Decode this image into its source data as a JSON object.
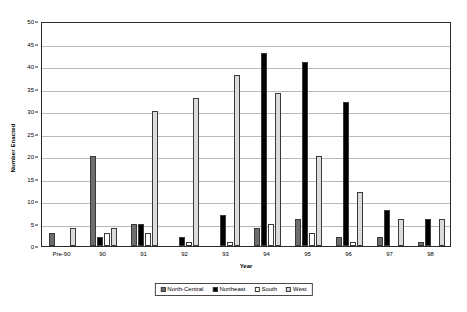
{
  "chart_data": {
    "type": "bar",
    "title": "",
    "xlabel": "Year",
    "ylabel": "Number Enacted",
    "categories": [
      "Pre-90",
      "90",
      "91",
      "92",
      "93",
      "94",
      "95",
      "96",
      "97",
      "98"
    ],
    "ylim": [
      0,
      50
    ],
    "yticks": [
      0,
      5,
      10,
      15,
      20,
      25,
      30,
      35,
      40,
      45,
      50
    ],
    "grid": true,
    "legend_position": "bottom",
    "series": [
      {
        "name": "North-Central",
        "color": "#6e6e6e",
        "values": [
          3,
          20,
          5,
          0,
          0,
          4,
          6,
          2,
          2,
          1
        ]
      },
      {
        "name": "Northeast",
        "color": "#000000",
        "values": [
          0,
          2,
          5,
          2,
          7,
          43,
          41,
          32,
          8,
          6
        ]
      },
      {
        "name": "South",
        "color": "#ffffff",
        "values": [
          0,
          3,
          3,
          1,
          1,
          5,
          3,
          1,
          0,
          0
        ]
      },
      {
        "name": "West",
        "color": "#dcdcdc",
        "values": [
          4,
          4,
          30,
          33,
          38,
          34,
          20,
          12,
          6,
          6
        ]
      }
    ]
  },
  "axes": {
    "y_title": "Number Enacted",
    "x_title": "Year"
  }
}
